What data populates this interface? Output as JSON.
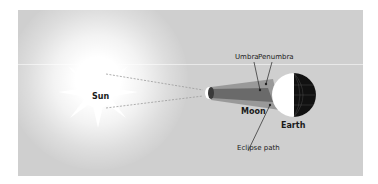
{
  "diagram": {
    "bodies": {
      "sun": "Sun",
      "moon": "Moon",
      "earth": "Earth"
    },
    "annotations": {
      "umbra": "Umbra",
      "penumbra": "Penumbra",
      "eclipse_path": "Eclipse path"
    },
    "colors": {
      "background": "#cfcfcf",
      "sun": "#ffffff",
      "earth_day": "#ffffff",
      "earth_night": "#111111",
      "shadow_cone": "#8c8c8c",
      "umbra": "#5e5e5e"
    }
  }
}
